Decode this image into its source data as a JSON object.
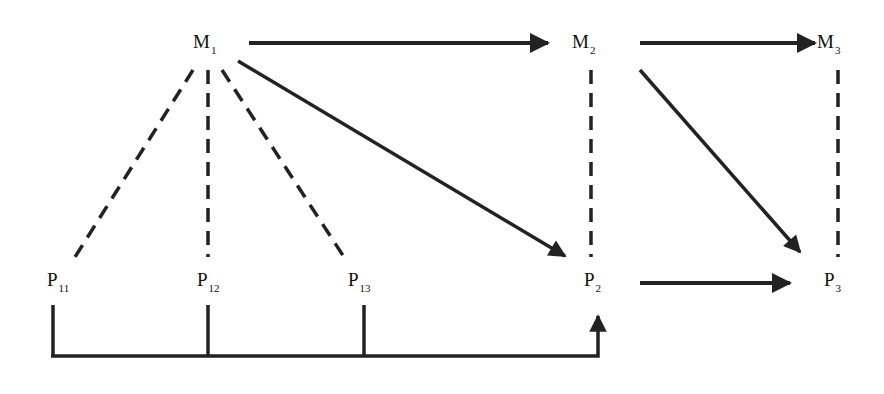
{
  "diagram": {
    "colors": {
      "stroke": "#222222",
      "text": "#111111",
      "background": "#ffffff"
    },
    "nodes": [
      {
        "id": "M1",
        "base": "M",
        "sub": "1",
        "x": 193,
        "y": 32
      },
      {
        "id": "M2",
        "base": "M",
        "sub": "2",
        "x": 572,
        "y": 32
      },
      {
        "id": "M3",
        "base": "M",
        "sub": "3",
        "x": 817,
        "y": 32
      },
      {
        "id": "P11",
        "base": "P",
        "sub": "11",
        "x": 47,
        "y": 270
      },
      {
        "id": "P12",
        "base": "P",
        "sub": "12",
        "x": 197,
        "y": 270
      },
      {
        "id": "P13",
        "base": "P",
        "sub": "13",
        "x": 348,
        "y": 270
      },
      {
        "id": "P2",
        "base": "P",
        "sub": "2",
        "x": 584,
        "y": 270
      },
      {
        "id": "P3",
        "base": "P",
        "sub": "3",
        "x": 824,
        "y": 270
      }
    ],
    "edges": [
      {
        "from": "M1",
        "to": "M2",
        "type": "solid-arrow"
      },
      {
        "from": "M2",
        "to": "M3",
        "type": "solid-arrow"
      },
      {
        "from": "M1",
        "to": "P2",
        "type": "solid-arrow"
      },
      {
        "from": "M2",
        "to": "P3",
        "type": "solid-arrow"
      },
      {
        "from": "P2",
        "to": "P3",
        "type": "solid-arrow"
      },
      {
        "from": "M1",
        "to": "P11",
        "type": "dashed"
      },
      {
        "from": "M1",
        "to": "P12",
        "type": "dashed"
      },
      {
        "from": "M1",
        "to": "P13",
        "type": "dashed"
      },
      {
        "from": "M2",
        "to": "P2",
        "type": "dashed"
      },
      {
        "from": "M3",
        "to": "P3",
        "type": "dashed"
      },
      {
        "from": [
          "P11",
          "P12",
          "P13"
        ],
        "to": "P2",
        "type": "bracket-arrow"
      }
    ]
  }
}
